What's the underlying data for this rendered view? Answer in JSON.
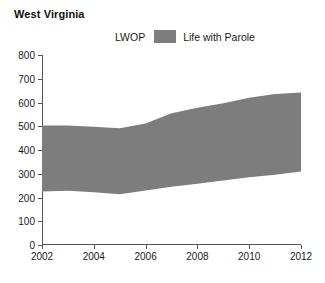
{
  "title": "West Virginia",
  "legend": {
    "items": [
      {
        "label": "LWOP",
        "color": "#ffffff",
        "swatch": false
      },
      {
        "label": "Life with Parole",
        "color": "#7d7d7d",
        "swatch": true
      }
    ]
  },
  "axes": {
    "y_ticks": [
      "0",
      "100",
      "200",
      "300",
      "400",
      "500",
      "600",
      "700",
      "800"
    ],
    "x_ticks": [
      "2002",
      "2004",
      "2006",
      "2008",
      "2010",
      "2012"
    ]
  },
  "chart_data": {
    "type": "area",
    "title": "West Virginia",
    "xlabel": "",
    "ylabel": "",
    "xlim": [
      2002,
      2012
    ],
    "ylim": [
      0,
      800
    ],
    "grid": false,
    "legend_position": "top",
    "stacked": true,
    "x": [
      2002,
      2003,
      2004,
      2005,
      2006,
      2007,
      2008,
      2009,
      2010,
      2011,
      2012
    ],
    "series": [
      {
        "name": "LWOP",
        "color": "#ffffff",
        "values": [
          225,
          228,
          222,
          214,
          230,
          245,
          258,
          272,
          285,
          296,
          310
        ]
      },
      {
        "name": "Life with Parole",
        "color": "#7d7d7d",
        "values": [
          278,
          275,
          276,
          278,
          282,
          310,
          320,
          325,
          335,
          340,
          332
        ]
      }
    ],
    "cumulative_top": [
      503,
      503,
      498,
      492,
      512,
      555,
      578,
      597,
      620,
      636,
      642
    ]
  }
}
